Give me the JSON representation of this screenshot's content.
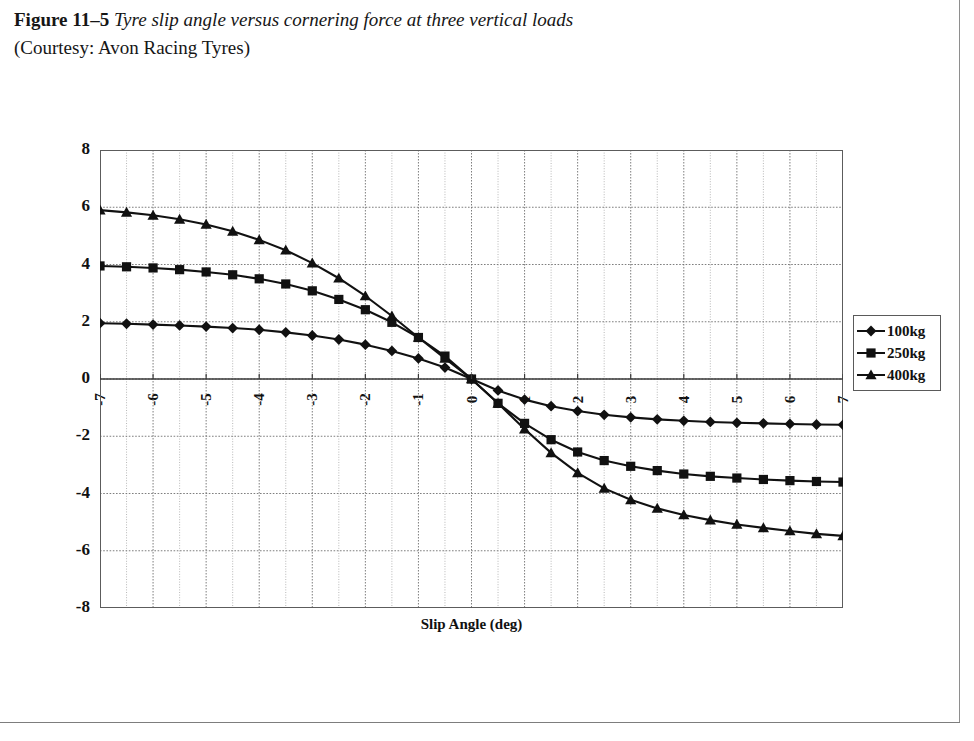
{
  "caption": {
    "figure_label": "Figure 11–5",
    "title": "Tyre slip angle versus cornering force at three vertical loads",
    "credit": "(Courtesy: Avon Racing Tyres)"
  },
  "chart_data": {
    "type": "line",
    "title": "",
    "xlabel": "Slip Angle (deg)",
    "ylabel": "Cornering Force (KN)",
    "xlim": [
      -7,
      7
    ],
    "ylim": [
      -8,
      8
    ],
    "xticks": [
      -7,
      -6,
      -5,
      -4,
      -3,
      -2,
      -1,
      0,
      1,
      2,
      3,
      4,
      5,
      6,
      7
    ],
    "yticks": [
      -8,
      -6,
      -4,
      -2,
      0,
      2,
      4,
      6,
      8
    ],
    "xtick_labels": [
      "-7",
      "-6",
      "-5",
      "-4",
      "-3",
      "-2",
      "-1",
      "0",
      "1",
      "2",
      "3",
      "4",
      "5",
      "6",
      "7"
    ],
    "ytick_labels": [
      "-8",
      "-6",
      "-4",
      "-2",
      "0",
      "2",
      "4",
      "6",
      "8"
    ],
    "grid": true,
    "grid_minor_x_step": 0.5,
    "legend_position": "right",
    "x": [
      -7,
      -6.5,
      -6,
      -5.5,
      -5,
      -4.5,
      -4,
      -3.5,
      -3,
      -2.5,
      -2,
      -1.5,
      -1,
      -0.5,
      0,
      0.5,
      1,
      1.5,
      2,
      2.5,
      3,
      3.5,
      4,
      4.5,
      5,
      5.5,
      6,
      6.5,
      7
    ],
    "series": [
      {
        "name": "100kg",
        "marker": "diamond",
        "color": "#111111",
        "values": [
          1.95,
          1.93,
          1.9,
          1.87,
          1.83,
          1.78,
          1.72,
          1.63,
          1.52,
          1.38,
          1.2,
          0.98,
          0.72,
          0.4,
          0.0,
          -0.4,
          -0.72,
          -0.95,
          -1.12,
          -1.25,
          -1.34,
          -1.41,
          -1.46,
          -1.5,
          -1.53,
          -1.55,
          -1.57,
          -1.59,
          -1.6
        ]
      },
      {
        "name": "250kg",
        "marker": "square",
        "color": "#111111",
        "values": [
          3.95,
          3.92,
          3.88,
          3.82,
          3.74,
          3.64,
          3.5,
          3.32,
          3.08,
          2.78,
          2.42,
          1.98,
          1.45,
          0.8,
          0.0,
          -0.85,
          -1.55,
          -2.12,
          -2.55,
          -2.85,
          -3.05,
          -3.2,
          -3.32,
          -3.4,
          -3.46,
          -3.51,
          -3.55,
          -3.58,
          -3.6
        ]
      },
      {
        "name": "400kg",
        "marker": "triangle",
        "color": "#111111",
        "values": [
          5.9,
          5.82,
          5.72,
          5.58,
          5.4,
          5.16,
          4.86,
          4.5,
          4.05,
          3.52,
          2.9,
          2.2,
          1.45,
          0.72,
          0.0,
          -0.85,
          -1.75,
          -2.58,
          -3.28,
          -3.82,
          -4.22,
          -4.52,
          -4.75,
          -4.93,
          -5.08,
          -5.2,
          -5.31,
          -5.41,
          -5.48
        ]
      }
    ]
  }
}
